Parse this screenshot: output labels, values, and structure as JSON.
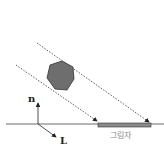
{
  "diagram": {
    "labels": {
      "normal": "n",
      "light": "L",
      "shadow": "그림자"
    },
    "colors": {
      "object_fill": "#6e6e6e",
      "object_stroke": "#333333",
      "shadow_fill": "#8a8a8a",
      "line": "#333333",
      "shadow_text": "#888888"
    }
  }
}
